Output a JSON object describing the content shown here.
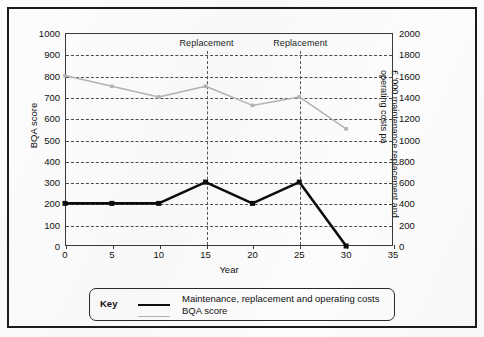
{
  "chart_data": {
    "type": "line",
    "title": "",
    "xlabel": "Year",
    "ylabel": "BQA score",
    "y2label": "£ '000 maintenance replacement and operating costs pa",
    "x": [
      0,
      5,
      10,
      15,
      20,
      25,
      30
    ],
    "xlim": [
      0,
      35
    ],
    "xticks": [
      0,
      5,
      10,
      15,
      20,
      25,
      30,
      35
    ],
    "ylim": [
      0,
      1000
    ],
    "yticks": [
      0,
      100,
      200,
      300,
      400,
      500,
      600,
      700,
      800,
      900,
      1000
    ],
    "y2lim": [
      0,
      2000
    ],
    "y2ticks": [
      0,
      200,
      400,
      600,
      800,
      1000,
      1200,
      1400,
      1600,
      1800,
      2000
    ],
    "grid": true,
    "legend_position": "below",
    "series": [
      {
        "name": "Maintenance, replacement and operating costs",
        "axis": "right",
        "color": "#0d0d0d",
        "marker": "square",
        "values": [
          400,
          400,
          400,
          600,
          400,
          600,
          0
        ]
      },
      {
        "name": "BQA score",
        "axis": "left",
        "color": "#b2b2b2",
        "marker": "square",
        "values": [
          800,
          750,
          700,
          750,
          660,
          700,
          550
        ]
      }
    ],
    "annotations": [
      {
        "label": "Replacement",
        "x": 15
      },
      {
        "label": "Replacement",
        "x": 25
      }
    ]
  },
  "legend": {
    "key_label": "Key",
    "entries": [
      "Maintenance, replacement and operating costs",
      "BQA score"
    ]
  },
  "axes": {
    "left_title": "BQA score",
    "right_title": "£ '000 maintenance replacement and operating costs pa",
    "x_title": "Year",
    "left_ticks": [
      "1000",
      "900",
      "800",
      "700",
      "600",
      "500",
      "400",
      "300",
      "200",
      "100",
      "0"
    ],
    "right_ticks": [
      "2000",
      "1800",
      "1600",
      "1400",
      "1200",
      "1000",
      "800",
      "600",
      "400",
      "200",
      "0"
    ],
    "x_ticks": [
      "0",
      "5",
      "10",
      "15",
      "20",
      "25",
      "30",
      "35"
    ]
  },
  "annotations": {
    "replacement_1": "Replacement",
    "replacement_2": "Replacement"
  },
  "colors": {
    "cost_series": "#0d0d0d",
    "bqa_series": "#b2b2b2",
    "frame": "#1b1b1b",
    "grid": "#4a4a4a"
  }
}
